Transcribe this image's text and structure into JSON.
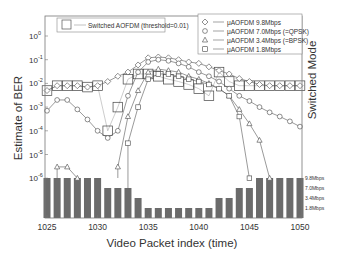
{
  "chart_data": {
    "type": "line",
    "title": "",
    "xlabel": "Video Packet index (time)",
    "ylabel": "Estimate of BER",
    "ylabel_right": "Switched Mode",
    "yscale": "log",
    "ylim": [
      1e-06,
      10
    ],
    "xlim": [
      1025,
      1050
    ],
    "x_ticks": [
      1025,
      1030,
      1035,
      1040,
      1045,
      1050
    ],
    "y_ticks": [
      "10^0",
      "10^-1",
      "10^-2",
      "10^-3",
      "10^-4",
      "10^-5",
      "10^-6"
    ],
    "right_axis_ticks": [
      "9.8Mbps",
      "7.0Mbps",
      "3.4Mbps",
      "1.8Mbps"
    ],
    "legend": [
      {
        "label": "Switched AOFDM (threshold=0.01)",
        "marker": "large-square"
      },
      {
        "label": "μAOFDM 9.8Mbps",
        "marker": "diamond"
      },
      {
        "label": "μAOFDM 7.0Mbps (=QPSK)",
        "marker": "circle"
      },
      {
        "label": "μAOFDM 3.4Mbps (=BPSK)",
        "marker": "triangle"
      },
      {
        "label": "μAOFDM 1.8Mbps",
        "marker": "square"
      }
    ],
    "x": [
      1025,
      1026,
      1027,
      1028,
      1029,
      1030,
      1031,
      1032,
      1033,
      1034,
      1035,
      1036,
      1037,
      1038,
      1039,
      1040,
      1041,
      1042,
      1043,
      1044,
      1045,
      1046,
      1047,
      1048,
      1049,
      1050
    ],
    "series": [
      {
        "name": "μAOFDM 9.8Mbps",
        "marker": "diamond",
        "values": [
          0.005,
          0.008,
          0.008,
          0.008,
          0.007,
          0.008,
          0.012,
          0.02,
          0.03,
          0.06,
          0.12,
          0.13,
          0.12,
          0.1,
          0.08,
          0.07,
          0.05,
          0.035,
          0.025,
          0.016,
          0.012,
          0.009,
          0.008,
          0.008,
          0.008,
          0.008
        ]
      },
      {
        "name": "μAOFDM 7.0Mbps (=QPSK)",
        "marker": "circle",
        "values": [
          0.0007,
          0.002,
          0.002,
          0.0008,
          0.0003,
          0.0001,
          5e-05,
          0.0001,
          0.003,
          0.03,
          0.08,
          0.1,
          0.09,
          0.07,
          0.05,
          0.03,
          0.02,
          0.012,
          0.006,
          0.003,
          0.0018,
          0.001,
          0.0006,
          0.0004,
          0.00025,
          0.00015
        ]
      },
      {
        "name": "μAOFDM 3.4Mbps (=BPSK)",
        "marker": "triangle",
        "values": [
          null,
          3e-06,
          3e-06,
          1e-06,
          null,
          null,
          null,
          3e-06,
          0.0004,
          0.005,
          0.03,
          0.04,
          0.035,
          0.03,
          0.02,
          0.015,
          0.01,
          0.006,
          0.003,
          0.0008,
          0.0002,
          4e-05,
          1e-06,
          null,
          null,
          null
        ]
      },
      {
        "name": "μAOFDM 1.8Mbps",
        "marker": "square",
        "values": [
          null,
          null,
          null,
          null,
          null,
          null,
          null,
          null,
          3e-05,
          0.001,
          0.015,
          0.025,
          0.025,
          0.02,
          0.015,
          0.012,
          0.009,
          0.006,
          0.003,
          0.0004,
          1e-06,
          null,
          null,
          null,
          null,
          null
        ]
      },
      {
        "name": "Switched AOFDM (threshold=0.01)",
        "marker": "large-square",
        "values": [
          0.005,
          0.008,
          0.008,
          0.008,
          0.007,
          0.008,
          0.0001,
          0.001,
          0.015,
          0.025,
          0.025,
          0.02,
          0.015,
          0.012,
          0.009,
          0.006,
          0.003,
          0.03,
          0.012,
          0.008,
          0.008,
          0.008,
          0.008,
          0.008,
          0.008,
          0.008
        ]
      }
    ],
    "switched_mode_bars": {
      "levels": [
        "9.8Mbps",
        "7.0Mbps",
        "3.4Mbps",
        "1.8Mbps"
      ],
      "values": [
        "9.8Mbps",
        "9.8Mbps",
        "9.8Mbps",
        "9.8Mbps",
        "9.8Mbps",
        "9.8Mbps",
        "7.0Mbps",
        "7.0Mbps",
        "7.0Mbps",
        "3.4Mbps",
        "1.8Mbps",
        "1.8Mbps",
        "1.8Mbps",
        "1.8Mbps",
        "1.8Mbps",
        "1.8Mbps",
        "1.8Mbps",
        "3.4Mbps",
        "3.4Mbps",
        "7.0Mbps",
        "7.0Mbps",
        "9.8Mbps",
        "9.8Mbps",
        "9.8Mbps",
        "9.8Mbps",
        "9.8Mbps"
      ]
    }
  }
}
